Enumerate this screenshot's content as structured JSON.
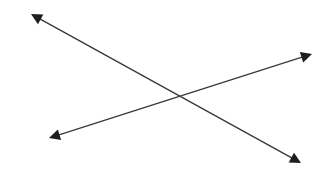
{
  "diagram": {
    "background": "#ffffff",
    "stroke_color": "#3a3a3a",
    "arrowhead_color": "#1e1e1e",
    "lines": [
      {
        "id": "line-descending",
        "start": [
          31,
          14
        ],
        "end": [
          301,
          163
        ],
        "arrowheads": [
          "start",
          "end"
        ]
      },
      {
        "id": "line-ascending",
        "start": [
          49,
          138
        ],
        "end": [
          312,
          54
        ],
        "arrowheads": [
          "start",
          "end"
        ]
      }
    ],
    "intersection": [
      180,
      96
    ]
  }
}
